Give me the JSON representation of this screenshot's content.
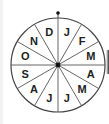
{
  "diagram": {
    "type": "month-wheel",
    "segments": 12,
    "labels": [
      "J",
      "F",
      "M",
      "A",
      "M",
      "J",
      "J",
      "A",
      "S",
      "O",
      "N",
      "D"
    ],
    "top_marker": "dot",
    "colors": {
      "stroke": "#333333",
      "text": "#222222",
      "fill": "#ffffff"
    }
  }
}
